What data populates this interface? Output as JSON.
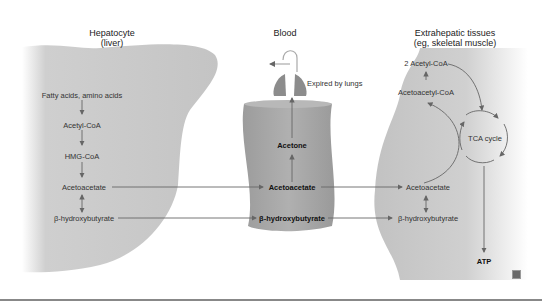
{
  "headers": {
    "hepatocyte": "Hepatocyte",
    "hepatocyte_sub": "(liver)",
    "blood": "Blood",
    "extrahepatic": "Extrahepatic tissues",
    "extrahepatic_sub": "(eg, skeletal muscle)"
  },
  "liver": {
    "items": [
      "Fatty acids, amino acids",
      "Acetyl-CoA",
      "HMG-CoA",
      "Acetoacetate",
      "β-hydroxybutyrate"
    ]
  },
  "blood": {
    "expired": "Expired by lungs",
    "acetone": "Acetone",
    "acetoacetate": "Acetoacetate",
    "bhb": "β-hydroxybutyrate"
  },
  "extrahepatic": {
    "acetyl_coa": "2 Acetyl-CoA",
    "acetoacetyl_coa": "Acetoacetyl-CoA",
    "tca": "TCA cycle",
    "acetoacetate": "Acetoacetate",
    "bhb": "β-hydroxybutyrate",
    "atp": "ATP"
  },
  "colors": {
    "tissue_gray": "#c8c8c8",
    "blood_gray": "#a9a9a9",
    "arrow": "#666666"
  }
}
